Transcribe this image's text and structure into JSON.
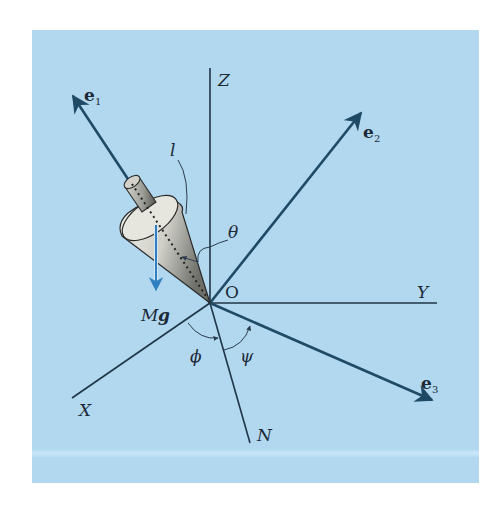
{
  "figure": {
    "background_color": "#b2d8f0",
    "axis_color": "#1f3447",
    "vector_color": "#1e4a66",
    "gravity_color": "#2f7fc0",
    "origin_label": "O",
    "axes": [
      {
        "name": "Z",
        "label": "Z"
      },
      {
        "name": "Y",
        "label": "Y"
      },
      {
        "name": "X",
        "label": "X"
      },
      {
        "name": "N",
        "label": "N"
      }
    ],
    "vectors": [
      {
        "name": "e1",
        "base": "e",
        "sub": "1"
      },
      {
        "name": "e2",
        "base": "e",
        "sub": "2"
      },
      {
        "name": "e3",
        "base": "e",
        "sub": "3"
      }
    ],
    "angles": {
      "theta": "θ",
      "phi": "ϕ",
      "psi": "ψ"
    },
    "length_label": "l",
    "force_label": {
      "mass": "M",
      "g": "g"
    }
  }
}
